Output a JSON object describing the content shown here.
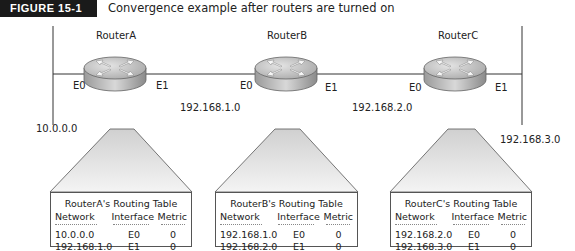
{
  "figure": {
    "tag": "FIGURE 15-1",
    "caption": "Convergence example after routers are turned on"
  },
  "routers": [
    {
      "name": "RouterA",
      "e0": "E0",
      "e1": "E1"
    },
    {
      "name": "RouterB",
      "e0": "E0",
      "e1": "E1"
    },
    {
      "name": "RouterC",
      "e0": "E0",
      "e1": "E1"
    }
  ],
  "networks": {
    "left": "10.0.0.0",
    "ab": "192.168.1.0",
    "bc": "192.168.2.0",
    "right": "192.168.3.0"
  },
  "tables": [
    {
      "title": "RouterA's Routing Table",
      "headers": [
        "Network",
        "Interface",
        "Metric"
      ],
      "rows": [
        [
          "10.0.0.0",
          "E0",
          "0"
        ],
        [
          "192.168.1.0",
          "E1",
          "0"
        ]
      ]
    },
    {
      "title": "RouterB's Routing Table",
      "headers": [
        "Network",
        "Interface",
        "Metric"
      ],
      "rows": [
        [
          "192.168.1.0",
          "E0",
          "0"
        ],
        [
          "192.168.2.0",
          "E1",
          "0"
        ]
      ]
    },
    {
      "title": "RouterC's Routing Table",
      "headers": [
        "Network",
        "Interface",
        "Metric"
      ],
      "rows": [
        [
          "192.168.2.0",
          "E0",
          "0"
        ],
        [
          "192.168.3.0",
          "E1",
          "0"
        ]
      ]
    }
  ]
}
